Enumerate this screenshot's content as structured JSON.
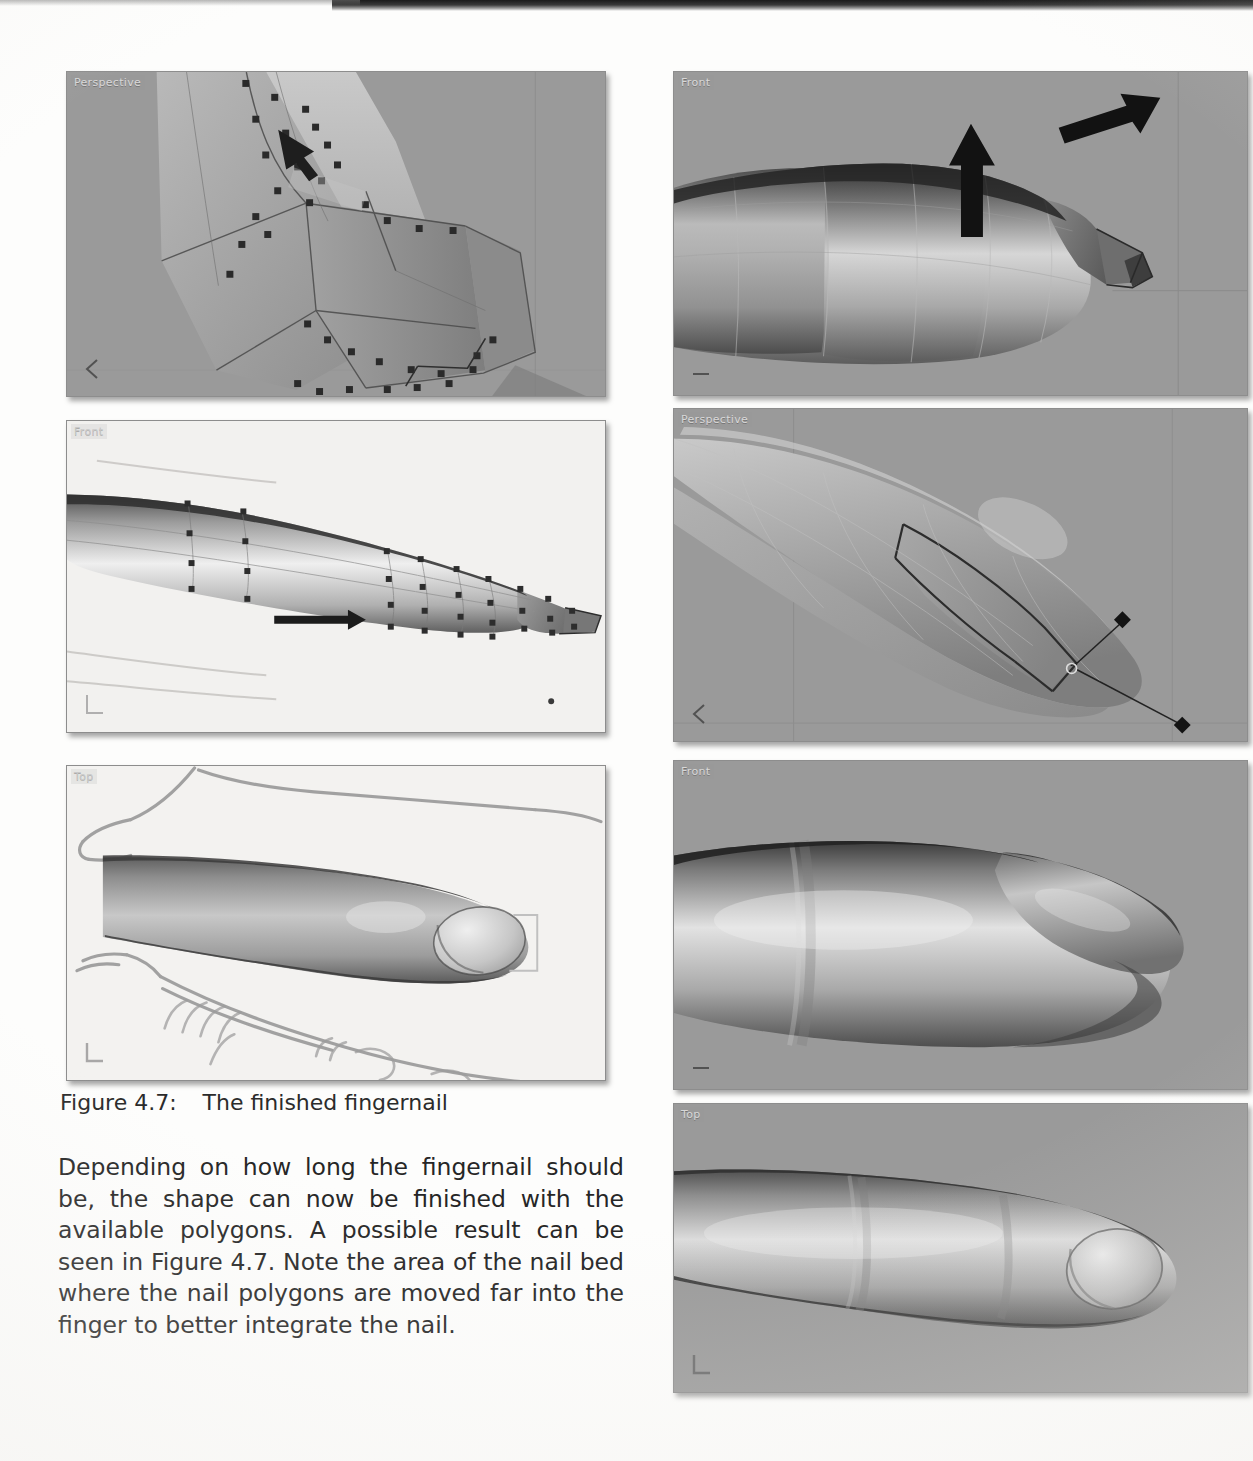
{
  "page": {
    "background_color": "#fdfdfc",
    "ink_color": "#262626"
  },
  "figure": {
    "caption_number": "Figure 4.7:",
    "caption_text": "The finished fingernail"
  },
  "body": {
    "paragraph": "Depending on how long the fingernail should be, the shape can now be finished with the available polygons. A possible result can be seen in Figure 4.7. Note the area of the nail bed where the nail polygons are moved far into the finger to better integrate the nail."
  },
  "viewports": [
    {
      "id": "vp-1",
      "label": "Perspective",
      "position": "top-left",
      "background": "#9a9a9a",
      "background_kind": "grey",
      "gizmo": "chevron-left",
      "content": "wireframe finger tip with selected vertices and move arrow"
    },
    {
      "id": "vp-2",
      "label": "Front",
      "position": "top-right",
      "background": "#9a9a9a",
      "background_kind": "grey",
      "gizmo": "dash",
      "content": "shaded finger side view with two black direction arrows"
    },
    {
      "id": "vp-3",
      "label": "Front",
      "position": "middle-left",
      "background": "#f2f1ef",
      "background_kind": "light",
      "gizmo": "corner-L",
      "content": "shaded finger with edge loop vertices and horizontal move arrow"
    },
    {
      "id": "vp-4",
      "label": "Perspective",
      "position": "middle-right",
      "background": "#9a9a9a",
      "background_kind": "grey",
      "gizmo": "chevron-left",
      "content": "perspective nail polygon selection with transform gizmo handles"
    },
    {
      "id": "vp-5",
      "label": "Top",
      "position": "bottom-left",
      "background": "#f2f1ef",
      "background_kind": "light",
      "gizmo": "corner-L",
      "content": "top view of finished finger over hand sketch underlay"
    },
    {
      "id": "vp-6",
      "label": "Front",
      "position": "bottom-right-upper",
      "background": "#9a9a9a",
      "background_kind": "grey",
      "gizmo": "dash",
      "content": "front view of finished smooth fingernail"
    },
    {
      "id": "vp-7",
      "label": "Top",
      "position": "bottom-right-lower",
      "background": "#9a9a9a",
      "background_kind": "grey",
      "gizmo": "corner-L",
      "content": "top view of finished smooth fingernail"
    }
  ]
}
